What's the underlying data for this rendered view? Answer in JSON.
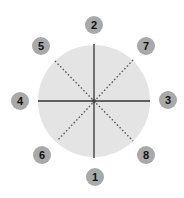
{
  "diagram": {
    "colors": {
      "circle_fill": "#e4e4e4",
      "solid_line": "#333333",
      "dotted_line": "#555555",
      "badge_fill": "#a9a9a9",
      "badge_text": "#111111",
      "center_dot": "#444444"
    },
    "circle": {
      "cx": 94,
      "cy": 101,
      "r": 56
    },
    "lines": {
      "solid": [
        {
          "name": "vertical-axis",
          "x1": 94,
          "y1": 44,
          "x2": 94,
          "y2": 158
        },
        {
          "name": "horizontal-axis",
          "x1": 38,
          "y1": 101,
          "x2": 150,
          "y2": 101
        }
      ],
      "dotted": [
        {
          "name": "diagonal-nw-se",
          "x1": 55,
          "y1": 61,
          "x2": 133,
          "y2": 141
        },
        {
          "name": "diagonal-ne-sw",
          "x1": 133,
          "y1": 60,
          "x2": 57,
          "y2": 141
        }
      ]
    },
    "markers": [
      {
        "label": "1",
        "position": "bottom",
        "cx": 95,
        "cy": 177
      },
      {
        "label": "2",
        "position": "top",
        "cx": 94,
        "cy": 25
      },
      {
        "label": "3",
        "position": "right",
        "cx": 168,
        "cy": 100
      },
      {
        "label": "4",
        "position": "left",
        "cx": 20,
        "cy": 101
      },
      {
        "label": "5",
        "position": "top-left",
        "cx": 41,
        "cy": 46
      },
      {
        "label": "6",
        "position": "bottom-left",
        "cx": 42,
        "cy": 155
      },
      {
        "label": "7",
        "position": "top-right",
        "cx": 146,
        "cy": 46
      },
      {
        "label": "8",
        "position": "bottom-right",
        "cx": 146,
        "cy": 155
      }
    ]
  }
}
